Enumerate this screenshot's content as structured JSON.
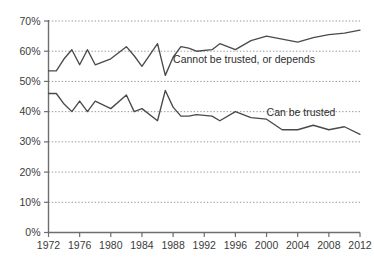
{
  "chart_data": {
    "type": "line",
    "title": "",
    "subtitle": "",
    "xlabel": "",
    "ylabel": "",
    "xlim": [
      1972,
      2012
    ],
    "ylim": [
      0,
      70
    ],
    "grid": true,
    "grid_axis": "y",
    "legend_position": "inline-annotation",
    "y_ticks": [
      0,
      10,
      20,
      30,
      40,
      50,
      60,
      70
    ],
    "y_tick_labels": [
      "0%",
      "10%",
      "20%",
      "30%",
      "40%",
      "50%",
      "60%",
      "70%"
    ],
    "x_ticks": [
      1972,
      1976,
      1980,
      1984,
      1988,
      1992,
      1996,
      2000,
      2004,
      2008,
      2012
    ],
    "x_tick_labels": [
      "1972",
      "1976",
      "1980",
      "1984",
      "1988",
      "1992",
      "1996",
      "2000",
      "2004",
      "2008",
      "2012"
    ],
    "x": [
      1972,
      1973,
      1974,
      1975,
      1976,
      1977,
      1978,
      1980,
      1982,
      1983,
      1984,
      1986,
      1987,
      1988,
      1989,
      1990,
      1991,
      1993,
      1994,
      1996,
      1998,
      2000,
      2002,
      2004,
      2006,
      2008,
      2010,
      2012
    ],
    "series": [
      {
        "name": "Cannot be trusted, or depends",
        "color": "#4a4a4a",
        "values": [
          53.5,
          53.5,
          57.5,
          60.5,
          55.5,
          60.5,
          55.5,
          57.5,
          61.5,
          58.5,
          55.0,
          62.5,
          52.0,
          58.0,
          61.5,
          61.0,
          60.0,
          60.5,
          62.5,
          60.5,
          63.5,
          65.0,
          64.0,
          63.0,
          64.5,
          65.5,
          66.0,
          67.0
        ],
        "label_text": "Cannot be trusted, or depends",
        "label_x": 1988,
        "label_y": 56.0
      },
      {
        "name": "Can be trusted",
        "color": "#4a4a4a",
        "values": [
          46.0,
          46.0,
          42.5,
          40.0,
          43.5,
          40.0,
          43.5,
          41.0,
          45.5,
          40.0,
          41.0,
          37.0,
          47.0,
          41.5,
          38.5,
          38.5,
          39.0,
          38.5,
          37.0,
          40.0,
          38.0,
          37.5,
          34.0,
          34.0,
          35.5,
          34.0,
          35.0,
          32.5
        ],
        "label_text": "Can be trusted",
        "label_x": 2000,
        "label_y": 38.5
      }
    ]
  },
  "axes": {
    "y_axis_name": "percentage-axis",
    "x_axis_name": "year-axis"
  }
}
